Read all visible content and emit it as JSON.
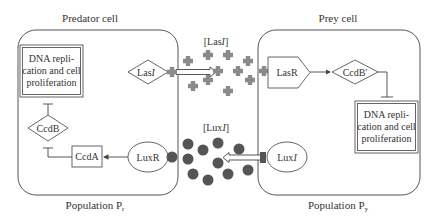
{
  "diagram": {
    "predator": {
      "title": "Predator cell",
      "population_label": "Population P",
      "population_sub": "r",
      "dna_box": [
        "DNA repli-",
        "cation and cell",
        "proliferation"
      ],
      "lasI": "Las",
      "lasI_italic": "I",
      "ccdB": "CcdB",
      "ccdA": "CcdA",
      "luxR": "LuxR"
    },
    "prey": {
      "title": "Prey cell",
      "population_label": "Population P",
      "population_sub": "y",
      "dna_box": [
        "DNA repli-",
        "cation and cell",
        "proliferation"
      ],
      "lasR": "LasR",
      "ccdB_prime": "CcdB'",
      "luxI": "Lux",
      "luxI_italic": "I"
    },
    "signals": {
      "lasI_label_prefix": "[Las",
      "lasI_label_italic": "I",
      "lasI_label_suffix": "]",
      "luxI_label_prefix": "[Lux",
      "luxI_label_italic": "I",
      "luxI_label_suffix": "]"
    },
    "colors": {
      "las_molecule": "#8a8a8a",
      "lux_molecule": "#555555",
      "outline": "#555555"
    }
  }
}
